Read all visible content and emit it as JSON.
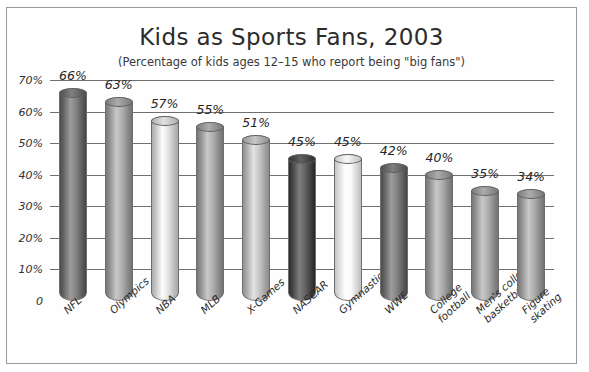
{
  "scan_sliver_text": "",
  "chart_data": {
    "type": "bar",
    "title": "Kids as Sports Fans, 2003",
    "subtitle": "(Percentage of kids ages 12–15 who report being \"big fans\")",
    "xlabel": "",
    "ylabel": "",
    "ylim": [
      0,
      70
    ],
    "grid": true,
    "legend": "none",
    "orientation": "vertical",
    "style": "3d-cylinder",
    "units": "percent",
    "y_ticks": [
      "0",
      "10%",
      "20%",
      "30%",
      "40%",
      "50%",
      "60%",
      "70%"
    ],
    "y_tick_values": [
      0,
      10,
      20,
      30,
      40,
      50,
      60,
      70
    ],
    "categories": [
      "NFL",
      "Olympics",
      "NBA",
      "MLB",
      "X-Games",
      "NASCAR",
      "Gymnastics",
      "WWE",
      "College football",
      "Men's college basketball",
      "Figure skating"
    ],
    "category_lines": [
      [
        "NFL"
      ],
      [
        "Olympics"
      ],
      [
        "NBA"
      ],
      [
        "MLB"
      ],
      [
        "X-Games"
      ],
      [
        "NASCAR"
      ],
      [
        "Gymnastics"
      ],
      [
        "WWE"
      ],
      [
        "College",
        "football"
      ],
      [
        "Men's college",
        "basketball"
      ],
      [
        "Figure",
        "skating"
      ]
    ],
    "values": [
      66,
      63,
      57,
      55,
      51,
      45,
      45,
      42,
      40,
      35,
      34
    ],
    "value_labels": [
      "66%",
      "63%",
      "57%",
      "55%",
      "51%",
      "45%",
      "45%",
      "42%",
      "40%",
      "35%",
      "34%"
    ],
    "bar_tones": [
      "dark",
      "medium",
      "light",
      "medium",
      "medium-light",
      "darkest",
      "lightest",
      "dark",
      "medium",
      "medium",
      "medium"
    ],
    "colors": {
      "dark": "#6e6e6e",
      "darkest": "#4f4f4f",
      "medium": "#9a9a9a",
      "medium-light": "#b4b4b4",
      "light": "#cfcfcf",
      "lightest": "#e6e6e6",
      "gridline": "#6f6f6f",
      "frame": "#9a9a9a",
      "text": "#2b2b2b",
      "background": "#ffffff"
    }
  }
}
